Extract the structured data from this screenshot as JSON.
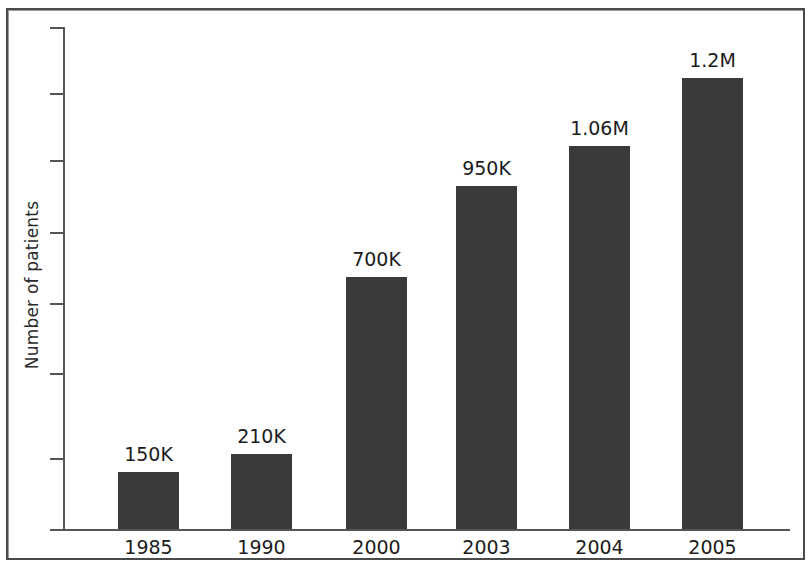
{
  "chart_data": {
    "type": "bar",
    "title": "",
    "xlabel": "",
    "ylabel": "Number of patients",
    "categories": [
      "1985",
      "1990",
      "2000",
      "2003",
      "2004",
      "2005"
    ],
    "values": [
      150000,
      210000,
      700000,
      950000,
      1060000,
      1200000
    ],
    "value_labels": [
      "150K",
      "210K",
      "700K",
      "950K",
      "1.06M",
      "1.2M"
    ],
    "ylim": [
      0,
      1350000
    ],
    "y_tick_labels": [
      "",
      "",
      "",
      "",
      "",
      "",
      "",
      ""
    ],
    "y_tick_count": 8,
    "grid": false,
    "legend": null,
    "bar_color": "#3a3a3a",
    "axis_color": "#555555",
    "text_color": "#1c1c1c",
    "frame_color": "#4a4a4a",
    "background": "#ffffff"
  },
  "axes": {
    "y_title": "Number of patients"
  },
  "bars": [
    {
      "category": "1985",
      "label": "150K",
      "value": 150000,
      "left": 118,
      "width": 61,
      "top": 472
    },
    {
      "category": "1990",
      "label": "210K",
      "value": 210000,
      "left": 231,
      "width": 61,
      "top": 454
    },
    {
      "category": "2000",
      "label": "700K",
      "value": 700000,
      "left": 346,
      "width": 61,
      "top": 277
    },
    {
      "category": "2003",
      "label": "950K",
      "value": 950000,
      "left": 456,
      "width": 61,
      "top": 186
    },
    {
      "category": "2004",
      "label": "1.06M",
      "value": 1060000,
      "left": 569,
      "width": 61,
      "top": 146
    },
    {
      "category": "2005",
      "label": "1.2M",
      "value": 1200000,
      "left": 682,
      "width": 61,
      "top": 78
    }
  ],
  "y_ticks": [
    27,
    93,
    160,
    232,
    303,
    373,
    458,
    529
  ]
}
